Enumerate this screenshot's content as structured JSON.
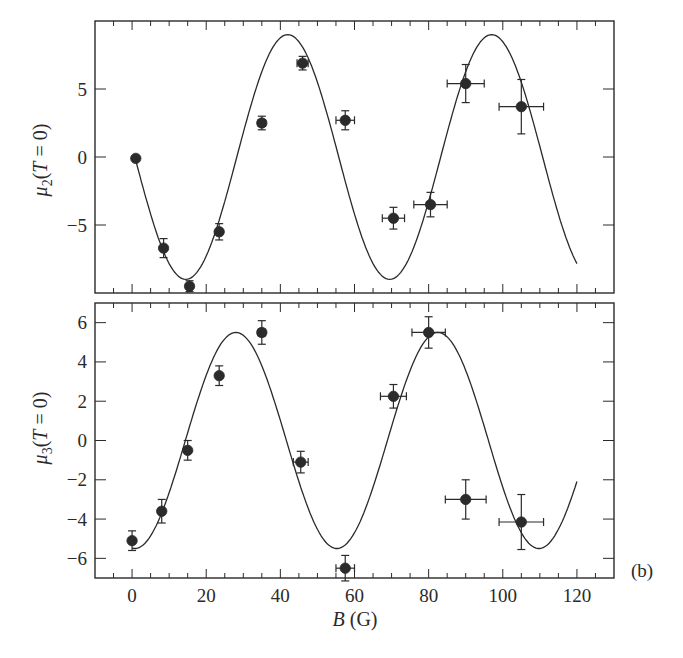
{
  "figure": {
    "panel_tag": "(b)",
    "xlabel_italic": "B",
    "xlabel_unit": " (G)",
    "colors": {
      "ink": "#2a2a2a",
      "marker": "#2b2b2b",
      "background": "#ffffff"
    }
  },
  "chart_data": [
    {
      "type": "scatter",
      "title": "",
      "panel": "top",
      "xlabel": "B (G)",
      "ylabel": "μ2(T = 0)",
      "ylabel_parts": {
        "symbol": "μ",
        "sub": "2",
        "rest": "(T = 0)"
      },
      "xlim": [
        -10,
        130
      ],
      "ylim": [
        -10,
        10
      ],
      "xticks": [
        0,
        20,
        40,
        60,
        80,
        100,
        120
      ],
      "xticks_labeled": false,
      "yticks": [
        5,
        0,
        -5
      ],
      "ytick_labels": [
        "5",
        "0",
        "−5"
      ],
      "grid": false,
      "legend": null,
      "series": [
        {
          "name": "data",
          "kind": "points_with_errorbars",
          "points": [
            {
              "x": 1,
              "y": -0.1,
              "xerr": 0,
              "yerr": 0
            },
            {
              "x": 8.5,
              "y": -6.7,
              "xerr": 0,
              "yerr": 0.7
            },
            {
              "x": 15.5,
              "y": -9.5,
              "xerr": 0,
              "yerr": 0.4
            },
            {
              "x": 23.5,
              "y": -5.5,
              "xerr": 0,
              "yerr": 0.6
            },
            {
              "x": 35,
              "y": 2.5,
              "xerr": 1,
              "yerr": 0.5
            },
            {
              "x": 46,
              "y": 6.9,
              "xerr": 1.5,
              "yerr": 0.5
            },
            {
              "x": 57.5,
              "y": 2.7,
              "xerr": 2.5,
              "yerr": 0.7
            },
            {
              "x": 70.5,
              "y": -4.5,
              "xerr": 3,
              "yerr": 0.8
            },
            {
              "x": 80.5,
              "y": -3.5,
              "xerr": 4.5,
              "yerr": 0.9
            },
            {
              "x": 90,
              "y": 5.4,
              "xerr": 5,
              "yerr": 1.4
            },
            {
              "x": 105,
              "y": 3.7,
              "xerr": 6,
              "yerr": 2.0
            }
          ]
        },
        {
          "name": "fit",
          "kind": "line",
          "model": "amplitude*cos(2*pi*(x-phase)/period)",
          "amplitude": 9.0,
          "period": 55,
          "phase": 42,
          "x_range": [
            1,
            120
          ],
          "features": {
            "max_1": [
              42,
              9.0
            ],
            "min_1": [
              15,
              -9.0
            ],
            "min_2": [
              69,
              -9.0
            ],
            "max_2": [
              97,
              9.0
            ],
            "end": [
              120,
              -7.9
            ]
          }
        }
      ]
    },
    {
      "type": "scatter",
      "title": "",
      "panel": "bottom",
      "xlabel": "B (G)",
      "ylabel": "μ3(T = 0)",
      "ylabel_parts": {
        "symbol": "μ",
        "sub": "3",
        "rest": "(T = 0)"
      },
      "xlim": [
        -10,
        130
      ],
      "ylim": [
        -7,
        7
      ],
      "xticks": [
        0,
        20,
        40,
        60,
        80,
        100,
        120
      ],
      "xtick_labels": [
        "0",
        "20",
        "40",
        "60",
        "80",
        "100",
        "120"
      ],
      "yticks": [
        6,
        4,
        2,
        0,
        -2,
        -4,
        -6
      ],
      "ytick_labels": [
        "6",
        "4",
        "2",
        "0",
        "−2",
        "−4",
        "−6"
      ],
      "grid": false,
      "legend": null,
      "series": [
        {
          "name": "data",
          "kind": "points_with_errorbars",
          "points": [
            {
              "x": 0,
              "y": -5.1,
              "xerr": 0,
              "yerr": 0.5
            },
            {
              "x": 8,
              "y": -3.6,
              "xerr": 0,
              "yerr": 0.6
            },
            {
              "x": 15,
              "y": -0.5,
              "xerr": 0,
              "yerr": 0.5
            },
            {
              "x": 23.5,
              "y": 3.3,
              "xerr": 0,
              "yerr": 0.5
            },
            {
              "x": 35,
              "y": 5.5,
              "xerr": 1,
              "yerr": 0.6
            },
            {
              "x": 45.5,
              "y": -1.1,
              "xerr": 2,
              "yerr": 0.55
            },
            {
              "x": 57.5,
              "y": -6.5,
              "xerr": 2.5,
              "yerr": 0.65
            },
            {
              "x": 70.5,
              "y": 2.25,
              "xerr": 3.5,
              "yerr": 0.6
            },
            {
              "x": 80,
              "y": 5.5,
              "xerr": 4.5,
              "yerr": 0.8
            },
            {
              "x": 90,
              "y": -3.0,
              "xerr": 5.5,
              "yerr": 1.0
            },
            {
              "x": 105,
              "y": -4.15,
              "xerr": 6,
              "yerr": 1.4
            }
          ]
        },
        {
          "name": "fit",
          "kind": "line",
          "model": "amplitude*cos(2*pi*(x-phase)/period)",
          "amplitude": 5.5,
          "period": 54.5,
          "phase": 28,
          "x_range": [
            0,
            120
          ],
          "features": {
            "max_1": [
              28,
              5.5
            ],
            "min_1": [
              55,
              -5.5
            ],
            "max_2": [
              82,
              5.5
            ],
            "min_2": [
              110,
              -5.5
            ],
            "end": [
              120,
              -2.2
            ]
          }
        }
      ]
    }
  ]
}
